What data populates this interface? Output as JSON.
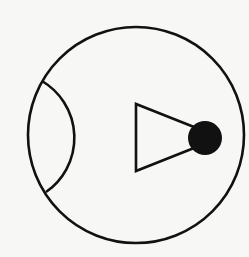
{
  "diagram": {
    "colors": {
      "background": "#f7f7f5",
      "stroke": "#111111",
      "fill_dot": "#111111"
    },
    "shapes": {
      "outer_circle": {
        "cx": 136,
        "cy": 135,
        "r": 108
      },
      "inner_arc": {
        "start": [
          42,
          81
        ],
        "end": [
          46,
          192
        ],
        "rx": 70,
        "ry": 70
      },
      "triangle": {
        "points": [
          [
            136,
            104
          ],
          [
            136,
            171
          ],
          [
            204,
            137
          ]
        ]
      },
      "dot": {
        "cx": 205,
        "cy": 138,
        "r": 17
      }
    }
  }
}
